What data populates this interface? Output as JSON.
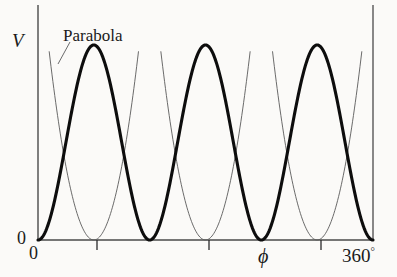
{
  "figure": {
    "background_color": "#fbfaf8",
    "curve_color": "#0d0d0d",
    "parabola_color": "#5a5a5a",
    "axis_color": "#4a4a4a"
  },
  "labels": {
    "y_axis": "V",
    "x_axis": "ϕ",
    "origin_y": "0",
    "origin_x": "0",
    "x_max": "360",
    "x_max_degree": "°",
    "annotation": "Parabola"
  },
  "chart_data": {
    "type": "line",
    "title": "",
    "xlabel": "ϕ",
    "ylabel": "V",
    "xlim": [
      0,
      360
    ],
    "ylim": [
      0,
      1
    ],
    "xticks": [
      0,
      120,
      240,
      360
    ],
    "xticklabels": [
      "0",
      "",
      "",
      "360°"
    ],
    "yticks": [
      0
    ],
    "yticklabels": [
      "0"
    ],
    "grid": false,
    "legend": null,
    "series": [
      {
        "name": "potential",
        "kind": "periodic-cosine",
        "period_deg": 120,
        "amplitude": 0.5,
        "offset": 0.5,
        "phase_deg": 0,
        "formula": "V = 0.5 - 0.5*cos(3*phi)",
        "minima_deg": [
          60,
          180,
          300
        ],
        "maxima_deg": [
          0,
          120,
          240,
          360
        ],
        "minimum_value": 0,
        "maximum_value": 1,
        "linewidth": 3.1,
        "color": "#0d0d0d"
      },
      {
        "name": "parabola-approximations",
        "kind": "parabola",
        "formula": "V = k*(phi - phi_min)^2",
        "k": 0.00042,
        "centers_deg": [
          60,
          180,
          300
        ],
        "half_width_deg": 48,
        "linewidth": 0.9,
        "color": "#5a5a5a"
      }
    ],
    "annotations": [
      {
        "text": "Parabola",
        "x_deg": 32,
        "y": 0.93,
        "leader_to_x_deg": 22,
        "leader_to_y": 0.78
      }
    ]
  }
}
